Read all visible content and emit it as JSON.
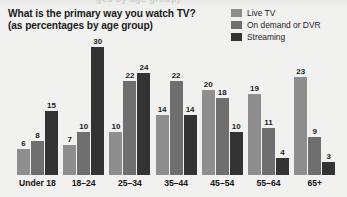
{
  "top_bleed_text": "ges by age group)",
  "title": {
    "line1": "What is the primary way you watch TV?",
    "line2": "(as percentages by age group)"
  },
  "legend": {
    "items": [
      {
        "label": "Live TV",
        "color": "#8e8e8e"
      },
      {
        "label": "On demand or DVR",
        "color": "#6f6f6f"
      },
      {
        "label": "Streaming",
        "color": "#333333"
      }
    ]
  },
  "chart_data": {
    "type": "bar",
    "title": "What is the primary way you watch TV? (as percentages by age group)",
    "xlabel": "",
    "ylabel": "",
    "ylim": [
      0,
      30
    ],
    "grid": false,
    "legend_position": "top-right",
    "value_labels": true,
    "unit": "percent",
    "categories": [
      "Under 18",
      "18–24",
      "25–34",
      "35–44",
      "45–54",
      "55–64",
      "65+"
    ],
    "series": [
      {
        "name": "Live TV",
        "color": "#8e8e8e",
        "values": [
          6,
          7,
          10,
          14,
          20,
          19,
          23
        ]
      },
      {
        "name": "On demand or DVR",
        "color": "#6f6f6f",
        "values": [
          8,
          10,
          22,
          22,
          18,
          11,
          9
        ]
      },
      {
        "name": "Streaming",
        "color": "#333333",
        "values": [
          15,
          30,
          24,
          14,
          10,
          4,
          3
        ]
      }
    ]
  }
}
